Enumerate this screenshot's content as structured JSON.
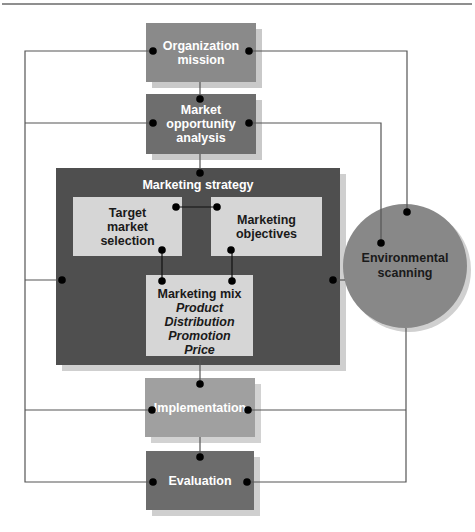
{
  "diagram": {
    "nodes": {
      "organization_mission": {
        "label_line1": "Organization",
        "label_line2": "mission",
        "color": "#8a8a8a"
      },
      "market_opportunity": {
        "label_line1": "Market",
        "label_line2": "opportunity",
        "label_line3": "analysis",
        "color": "#6e6e6e"
      },
      "marketing_strategy": {
        "label": "Marketing strategy",
        "color": "#4f4f4f"
      },
      "target_market": {
        "label_line1": "Target",
        "label_line2": "market",
        "label_line3": "selection",
        "color": "#d6d6d6"
      },
      "marketing_objectives": {
        "label_line1": "Marketing",
        "label_line2": "objectives",
        "color": "#d6d6d6"
      },
      "marketing_mix": {
        "label": "Marketing mix",
        "items": [
          "Product",
          "Distribution",
          "Promotion",
          "Price"
        ],
        "color": "#d6d6d6"
      },
      "environmental_scanning": {
        "label_line1": "Environmental",
        "label_line2": "scanning",
        "color": "#888888"
      },
      "implementation": {
        "label": "Implementation",
        "color": "#a0a0a0"
      },
      "evaluation": {
        "label": "Evaluation",
        "color": "#6c6c6c"
      }
    },
    "edges": [
      [
        "organization_mission",
        "market_opportunity"
      ],
      [
        "market_opportunity",
        "marketing_strategy"
      ],
      [
        "target_market",
        "marketing_objectives"
      ],
      [
        "target_market",
        "marketing_mix"
      ],
      [
        "marketing_objectives",
        "marketing_mix"
      ],
      [
        "marketing_strategy",
        "implementation"
      ],
      [
        "implementation",
        "evaluation"
      ],
      [
        "environmental_scanning",
        "organization_mission"
      ],
      [
        "environmental_scanning",
        "market_opportunity"
      ],
      [
        "environmental_scanning",
        "marketing_strategy"
      ],
      [
        "environmental_scanning",
        "implementation"
      ],
      [
        "environmental_scanning",
        "evaluation"
      ],
      [
        "feedback_left",
        "organization_mission"
      ],
      [
        "feedback_left",
        "market_opportunity"
      ],
      [
        "feedback_left",
        "marketing_strategy"
      ],
      [
        "feedback_left",
        "implementation"
      ],
      [
        "feedback_left",
        "evaluation"
      ]
    ],
    "colors": {
      "line": "#555555",
      "dot": "#000000",
      "shadow": "#c8c8c8"
    }
  }
}
